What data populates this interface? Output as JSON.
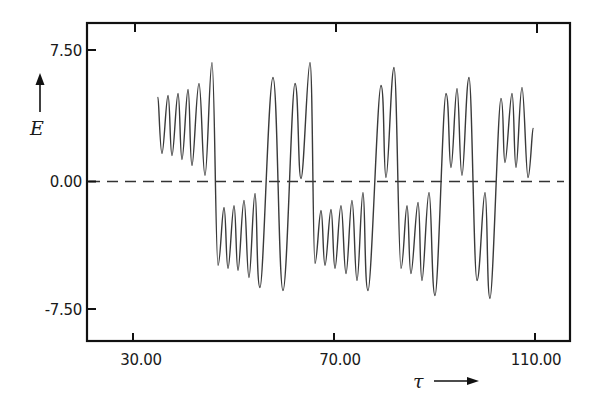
{
  "chart_data": {
    "type": "line",
    "title": "",
    "xlabel": "τ",
    "ylabel": "E",
    "xlim": [
      20.7,
      117.4
    ],
    "ylim": [
      -9.3,
      9.1
    ],
    "x_ticks": [
      30.0,
      70.0,
      110.0
    ],
    "x_tick_labels": [
      "30.00",
      "70.00",
      "110.00"
    ],
    "y_ticks": [
      7.5,
      0.0,
      -7.5
    ],
    "y_tick_labels": [
      "7.50",
      "0.00",
      "-7.50"
    ],
    "grid": false,
    "legend": null,
    "reference_line": {
      "type": "horizontal-dashed",
      "y": 0.0
    },
    "annotations": [
      "E ↑ (arrow along y-axis)",
      "τ → (arrow along x-axis)"
    ],
    "colors": {
      "curve": "#3a3a3a",
      "frame": "#111111",
      "background": "#ffffff"
    },
    "series": [
      {
        "name": "E(τ)",
        "x": [
          34.98,
          35.77,
          36.97,
          37.76,
          38.96,
          39.75,
          40.95,
          41.74,
          43.13,
          44.33,
          45.72,
          46.92,
          48.11,
          48.91,
          50.1,
          50.9,
          52.09,
          53.08,
          54.28,
          55.27,
          57.86,
          59.85,
          62.24,
          63.43,
          65.22,
          66.22,
          67.41,
          68.21,
          69.4,
          70.2,
          71.39,
          72.39,
          73.58,
          74.58,
          75.77,
          76.77,
          79.35,
          80.35,
          81.94,
          83.33,
          84.53,
          85.32,
          86.72,
          87.51,
          88.91,
          90.1,
          92.29,
          93.28,
          94.48,
          95.47,
          96.87,
          98.46,
          100.05,
          101.04,
          103.23,
          104.03,
          105.42,
          106.22,
          107.41,
          108.61,
          109.6
        ],
        "y": [
          4.88,
          1.63,
          5.0,
          1.51,
          5.12,
          1.28,
          5.35,
          0.93,
          5.7,
          0.35,
          6.92,
          -4.88,
          -1.51,
          -5.06,
          -1.4,
          -5.17,
          -1.1,
          -5.58,
          -0.7,
          -6.16,
          6.05,
          -6.34,
          5.7,
          0.17,
          6.92,
          -4.77,
          -1.69,
          -4.88,
          -1.63,
          -5.06,
          -1.4,
          -5.35,
          -1.1,
          -5.76,
          -0.64,
          -6.34,
          5.58,
          0.23,
          6.63,
          -5.06,
          -1.4,
          -5.35,
          -1.22,
          -5.76,
          -0.64,
          -6.63,
          5.12,
          0.81,
          5.41,
          0.35,
          6.05,
          -5.76,
          -0.64,
          -6.8,
          4.83,
          1.1,
          5.12,
          0.81,
          5.47,
          0.23,
          3.08
        ]
      }
    ]
  },
  "axes": {
    "x": {
      "label": "τ",
      "ticks": [
        "30.00",
        "70.00",
        "110.00"
      ]
    },
    "y": {
      "label": "E",
      "ticks": [
        "7.50",
        "0.00",
        "-7.50"
      ]
    }
  }
}
